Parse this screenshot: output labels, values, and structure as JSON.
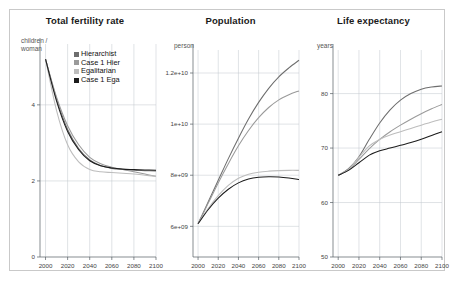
{
  "figure": {
    "border_color": "#c9c9c9",
    "background": "#ffffff"
  },
  "legend": {
    "position": "inside-panel-1-top",
    "entries": [
      {
        "label": "Hierarchist",
        "color": "#6e6e6e",
        "swatch": "square-swatch"
      },
      {
        "label": "Case 1 Hier",
        "color": "#9a9a9a",
        "swatch": "square-swatch"
      },
      {
        "label": "Egalitarian",
        "color": "#bdbdbd",
        "swatch": "square-swatch"
      },
      {
        "label": "Case 1 Ega",
        "color": "#1c1c1c",
        "swatch": "square-swatch"
      }
    ]
  },
  "chart_data": [
    {
      "type": "line",
      "title": "Total fertility rate",
      "ylabel": "children /\nwoman",
      "xlabel": "",
      "xlim": [
        1995,
        2100
      ],
      "ylim": [
        0,
        5.6
      ],
      "grid": true,
      "xticks": [
        2000,
        2020,
        2040,
        2060,
        2080,
        2100
      ],
      "yticks": [
        0,
        2,
        4
      ],
      "x": [
        2000,
        2010,
        2020,
        2030,
        2040,
        2050,
        2060,
        2070,
        2080,
        2090,
        2100
      ],
      "series": [
        {
          "name": "Hierarchist",
          "color": "#6e6e6e",
          "values": [
            5.2,
            4.15,
            3.35,
            2.85,
            2.55,
            2.4,
            2.33,
            2.3,
            2.28,
            2.27,
            2.26
          ]
        },
        {
          "name": "Case 1 Hier",
          "color": "#9a9a9a",
          "values": [
            5.2,
            4.2,
            3.45,
            2.95,
            2.62,
            2.45,
            2.36,
            2.3,
            2.24,
            2.18,
            2.12
          ]
        },
        {
          "name": "Egalitarian",
          "color": "#bdbdbd",
          "values": [
            5.2,
            3.85,
            2.95,
            2.5,
            2.3,
            2.24,
            2.22,
            2.2,
            2.18,
            2.15,
            2.12
          ]
        },
        {
          "name": "Case 1 Ega",
          "color": "#1c1c1c",
          "values": [
            5.2,
            4.1,
            3.3,
            2.82,
            2.53,
            2.4,
            2.34,
            2.31,
            2.3,
            2.29,
            2.28
          ]
        }
      ]
    },
    {
      "type": "line",
      "title": "Population",
      "ylabel": "person",
      "xlabel": "",
      "xlim": [
        1995,
        2100
      ],
      "ylim": [
        4800000000,
        12900000000
      ],
      "grid": true,
      "xticks": [
        2000,
        2020,
        2040,
        2060,
        2080,
        2100
      ],
      "yticks": [
        6000000000,
        8000000000,
        10000000000,
        12000000000
      ],
      "ytick_labels": [
        "6e+09",
        "8e+09",
        "1e+10",
        "1.2e+10"
      ],
      "x": [
        2000,
        2010,
        2020,
        2030,
        2040,
        2050,
        2060,
        2070,
        2080,
        2090,
        2100
      ],
      "series": [
        {
          "name": "Hierarchist",
          "color": "#6e6e6e",
          "values": [
            6100000000,
            6950000000,
            7800000000,
            8650000000,
            9450000000,
            10200000000,
            10850000000,
            11400000000,
            11850000000,
            12200000000,
            12500000000
          ]
        },
        {
          "name": "Case 1 Hier",
          "color": "#9a9a9a",
          "values": [
            6100000000,
            6900000000,
            7700000000,
            8450000000,
            9150000000,
            9750000000,
            10250000000,
            10650000000,
            10950000000,
            11150000000,
            11300000000
          ]
        },
        {
          "name": "Egalitarian",
          "color": "#bdbdbd",
          "values": [
            6100000000,
            6700000000,
            7200000000,
            7600000000,
            7880000000,
            8040000000,
            8120000000,
            8160000000,
            8180000000,
            8190000000,
            8190000000
          ]
        },
        {
          "name": "Case 1 Ega",
          "color": "#1c1c1c",
          "values": [
            6100000000,
            6650000000,
            7100000000,
            7450000000,
            7700000000,
            7850000000,
            7920000000,
            7940000000,
            7930000000,
            7890000000,
            7830000000
          ]
        }
      ]
    },
    {
      "type": "line",
      "title": "Life expectancy",
      "ylabel": "years",
      "xlabel": "",
      "xlim": [
        1995,
        2100
      ],
      "ylim": [
        50,
        88
      ],
      "grid": true,
      "xticks": [
        2000,
        2020,
        2040,
        2060,
        2080,
        2100
      ],
      "yticks": [
        50,
        60,
        70,
        80
      ],
      "x": [
        2000,
        2010,
        2020,
        2030,
        2040,
        2050,
        2060,
        2070,
        2080,
        2090,
        2100
      ],
      "series": [
        {
          "name": "Hierarchist",
          "color": "#6e6e6e",
          "values": [
            65.0,
            66.2,
            68.4,
            71.6,
            74.6,
            77.0,
            78.8,
            80.0,
            80.8,
            81.2,
            81.4
          ]
        },
        {
          "name": "Case 1 Hier",
          "color": "#9a9a9a",
          "values": [
            65.0,
            66.0,
            67.9,
            69.9,
            71.6,
            73.0,
            74.2,
            75.3,
            76.3,
            77.2,
            78.0
          ]
        },
        {
          "name": "Egalitarian",
          "color": "#bdbdbd",
          "values": [
            65.0,
            66.1,
            68.3,
            70.4,
            71.6,
            72.4,
            73.0,
            73.6,
            74.2,
            74.8,
            75.3
          ]
        },
        {
          "name": "Case 1 Ega",
          "color": "#1c1c1c",
          "values": [
            65.0,
            65.9,
            67.3,
            68.7,
            69.5,
            70.0,
            70.5,
            71.0,
            71.6,
            72.3,
            73.0
          ]
        }
      ]
    }
  ]
}
